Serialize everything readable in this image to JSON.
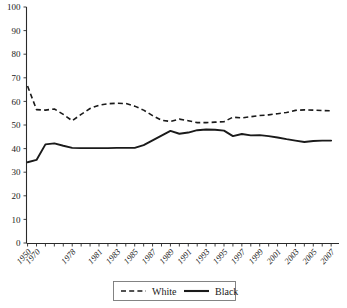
{
  "chart_data": {
    "type": "line",
    "title": "",
    "xlabel": "",
    "ylabel": "",
    "ylim": [
      0,
      100
    ],
    "ytick_step": 10,
    "grid": false,
    "legend_position": "bottom-center",
    "ytick_labels": [
      "100",
      "90",
      "80",
      "70",
      "60",
      "50",
      "40",
      "30",
      "20",
      "10",
      "0"
    ],
    "yticks": [
      100,
      90,
      80,
      70,
      60,
      50,
      40,
      30,
      20,
      10,
      0
    ],
    "x": [
      1950,
      1970,
      1978,
      1981,
      1983,
      1985,
      1987,
      1989,
      1991,
      1993,
      1995,
      1997,
      1999,
      2001,
      2003,
      2005,
      2007
    ],
    "xtick_labels": [
      "1950",
      "1970",
      "1978",
      "1981",
      "1983",
      "1985",
      "1987",
      "1989",
      "1991",
      "1993",
      "1995",
      "1997",
      "1999",
      "2001",
      "2003",
      "2005",
      "2007"
    ],
    "x_positions_all": [
      1950,
      1970,
      1972,
      1974,
      1976,
      1978,
      1979,
      1980,
      1981,
      1982,
      1983,
      1984,
      1985,
      1986,
      1987,
      1988,
      1989,
      1990,
      1991,
      1992,
      1993,
      1994,
      1995,
      1996,
      1997,
      1998,
      1999,
      2000,
      2001,
      2002,
      2003,
      2004,
      2005,
      2006,
      2007
    ],
    "series": [
      {
        "name": "White",
        "style": "dashed",
        "color": "#1a1a1a",
        "x": [
          1950,
          1970,
          1972,
          1974,
          1976,
          1978,
          1979,
          1980,
          1981,
          1982,
          1983,
          1984,
          1985,
          1986,
          1987,
          1988,
          1989,
          1990,
          1991,
          1992,
          1993,
          1994,
          1995,
          1996,
          1997,
          1998,
          1999,
          2000,
          2001,
          2002,
          2003,
          2004,
          2005,
          2006,
          2007
        ],
        "values": [
          66.5,
          56.5,
          56.3,
          56.8,
          54.5,
          51.8,
          54.5,
          57.0,
          58.4,
          59.0,
          59.2,
          59.1,
          58.0,
          56.3,
          54.0,
          52.0,
          51.5,
          52.5,
          51.8,
          51.0,
          51.0,
          51.2,
          51.4,
          53.3,
          53.0,
          53.5,
          54.0,
          54.3,
          54.8,
          55.3,
          56.2,
          56.4,
          56.3,
          56.1,
          56.0
        ]
      },
      {
        "name": "Black",
        "style": "solid",
        "color": "#1a1a1a",
        "x": [
          1950,
          1970,
          1972,
          1974,
          1976,
          1978,
          1979,
          1980,
          1981,
          1982,
          1983,
          1984,
          1985,
          1986,
          1987,
          1988,
          1989,
          1990,
          1991,
          1992,
          1993,
          1994,
          1995,
          1996,
          1997,
          1998,
          1999,
          2000,
          2001,
          2002,
          2003,
          2004,
          2005,
          2006,
          2007
        ],
        "values": [
          34.2,
          35.2,
          41.8,
          42.2,
          41.2,
          40.3,
          40.2,
          40.2,
          40.2,
          40.2,
          40.3,
          40.3,
          40.3,
          41.5,
          43.5,
          45.5,
          47.5,
          46.3,
          46.8,
          47.8,
          48.1,
          48.0,
          47.6,
          45.3,
          46.2,
          45.6,
          45.7,
          45.3,
          44.7,
          44.0,
          43.4,
          42.8,
          43.2,
          43.4,
          43.4
        ]
      }
    ]
  },
  "legend": {
    "items": [
      {
        "label": "White",
        "style": "dashed"
      },
      {
        "label": "Black",
        "style": "solid"
      }
    ]
  }
}
